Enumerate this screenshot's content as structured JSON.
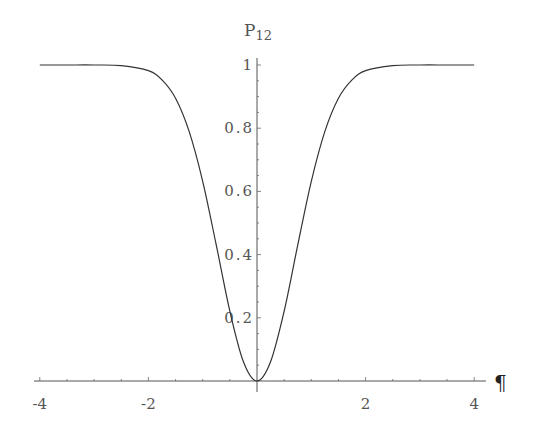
{
  "chart_data": {
    "type": "line",
    "title": "",
    "xlabel": "¶",
    "ylabel": "P12",
    "ylabel_main": "P",
    "ylabel_sub": "12",
    "xlim": [
      -4,
      4
    ],
    "ylim": [
      0,
      1
    ],
    "grid": false,
    "legend": null,
    "x_ticks": [
      -4,
      -2,
      2,
      4
    ],
    "x_tick_labels": [
      "-4",
      "-2",
      "2",
      "4"
    ],
    "y_ticks": [
      0.2,
      0.4,
      0.6,
      0.8,
      1
    ],
    "y_tick_labels": [
      "0.2",
      "0.4",
      "0.6",
      "0.8",
      "1"
    ],
    "series": [
      {
        "name": "P12",
        "x": [
          -4,
          -3.5,
          -3,
          -2.5,
          -2,
          -1.75,
          -1.5,
          -1.25,
          -1,
          -0.75,
          -0.5,
          -0.25,
          0,
          0.25,
          0.5,
          0.75,
          1,
          1.25,
          1.5,
          1.75,
          2,
          2.5,
          3,
          3.5,
          4
        ],
        "values": [
          1.0,
          1.0,
          1.0,
          0.998,
          0.982,
          0.953,
          0.895,
          0.79,
          0.632,
          0.43,
          0.221,
          0.061,
          0.0,
          0.061,
          0.221,
          0.43,
          0.632,
          0.79,
          0.895,
          0.953,
          0.982,
          0.998,
          1.0,
          1.0,
          1.0
        ]
      }
    ]
  }
}
